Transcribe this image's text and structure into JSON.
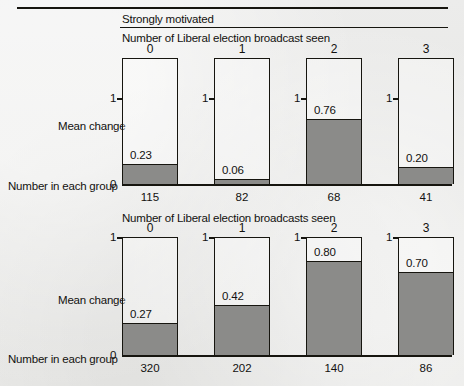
{
  "figure": {
    "section_label": "Strongly motivated",
    "axis_label": "Mean change",
    "group_label": "Number in each group",
    "tick_one": "1",
    "tick_zero": "0"
  },
  "chart_data": [
    {
      "type": "bar",
      "title": "Number of Liberal election broadcast seen",
      "panel": "Strongly motivated",
      "categories": [
        "0",
        "1",
        "2",
        "3"
      ],
      "values": [
        0.23,
        0.06,
        0.76,
        0.2
      ],
      "value_labels": [
        "0.23",
        "0.06",
        "0.76",
        "0.20"
      ],
      "group_sizes": [
        115,
        82,
        68,
        41
      ],
      "group_size_labels": [
        "115",
        "82",
        "68",
        "41"
      ],
      "xlabel": "Number of Liberal election broadcast seen",
      "ylabel": "Mean change",
      "ylim": [
        0,
        1
      ],
      "ytick_labels": [
        "0",
        "1"
      ],
      "grid": false,
      "legend": "none",
      "group_size_row_label": "Number in each group"
    },
    {
      "type": "bar",
      "title": "Number of Liberal election broadcasts seen",
      "panel": "",
      "categories": [
        "0",
        "1",
        "2",
        "3"
      ],
      "values": [
        0.27,
        0.42,
        0.8,
        0.7
      ],
      "value_labels": [
        "0.27",
        "0.42",
        "0.80",
        "0.70"
      ],
      "group_sizes": [
        320,
        202,
        140,
        86
      ],
      "group_size_labels": [
        "320",
        "202",
        "140",
        "86"
      ],
      "xlabel": "Number of Liberal election broadcasts seen",
      "ylabel": "Mean change",
      "ylim": [
        0,
        1
      ],
      "ytick_labels": [
        "0",
        "1"
      ],
      "grid": false,
      "legend": "none",
      "group_size_row_label": "Number in each group"
    }
  ],
  "colors": {
    "bar_fill": "#8b8b89",
    "ink": "#16150f",
    "paper": "#e9e9e7"
  }
}
